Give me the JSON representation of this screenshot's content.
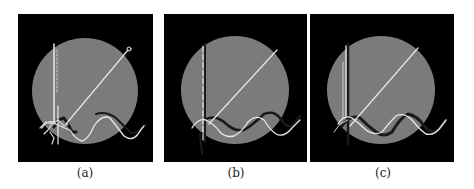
{
  "figure": {
    "background": "#ffffff",
    "panel_background": "#000000",
    "disk_color": "#7b7b7b",
    "curve_color": "#e8e8e8",
    "shadow_color": "#1a1a1a",
    "panels": [
      {
        "id": "a",
        "caption": "(a)",
        "left": 18,
        "width": 135,
        "cx": 67,
        "cy": 77,
        "r": 53
      },
      {
        "id": "b",
        "caption": "(b)",
        "left": 164,
        "width": 143,
        "cx": 71,
        "cy": 76,
        "r": 54
      },
      {
        "id": "c",
        "caption": "(c)",
        "left": 310,
        "width": 144,
        "cx": 71,
        "cy": 76,
        "r": 54
      }
    ]
  }
}
